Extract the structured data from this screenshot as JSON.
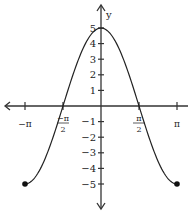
{
  "chart_data": {
    "type": "line",
    "title": "",
    "function": "y = 5 cos(x)",
    "xlabel": "",
    "ylabel": "y",
    "xlim": [
      -3.14159,
      3.14159
    ],
    "ylim": [
      -6,
      6
    ],
    "grid": false,
    "legend": null,
    "x_ticks": [
      {
        "value": -3.14159,
        "label": "−π"
      },
      {
        "value": -1.5708,
        "label_num": "−π",
        "label_den": "2"
      },
      {
        "value": 1.5708,
        "label_num": "π",
        "label_den": "2"
      },
      {
        "value": 3.14159,
        "label": "π"
      }
    ],
    "y_ticks": [
      {
        "value": 5,
        "label": "5"
      },
      {
        "value": 4,
        "label": "4"
      },
      {
        "value": 3,
        "label": "3"
      },
      {
        "value": 2,
        "label": "2"
      },
      {
        "value": 1,
        "label": "1"
      },
      {
        "value": -1,
        "label": "−1"
      },
      {
        "value": -2,
        "label": "−2"
      },
      {
        "value": -3,
        "label": "−3"
      },
      {
        "value": -4,
        "label": "−4"
      },
      {
        "value": -5,
        "label": "−5"
      }
    ],
    "series": [
      {
        "name": "5cos(x)",
        "x": [
          -3.14159,
          -2.356,
          -1.5708,
          -0.785,
          0,
          0.785,
          1.5708,
          2.356,
          3.14159
        ],
        "y": [
          -5,
          -3.54,
          0,
          3.54,
          5,
          3.54,
          0,
          -3.54,
          -5
        ]
      }
    ],
    "endpoints": [
      {
        "x": -3.14159,
        "y": -5,
        "closed": true
      },
      {
        "x": 3.14159,
        "y": -5,
        "closed": true
      }
    ],
    "colors": {
      "curve": "#222222",
      "axes": "#333333"
    }
  }
}
